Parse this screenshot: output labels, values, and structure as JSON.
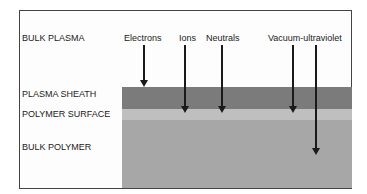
{
  "diagram": {
    "regions": [
      {
        "label": "BULK PLASMA"
      },
      {
        "label": "PLASMA SHEATH"
      },
      {
        "label": "POLYMER SURFACE"
      },
      {
        "label": "BULK POLYMER"
      }
    ],
    "species": [
      {
        "label": "Electrons",
        "penetrates_to": "plasma sheath"
      },
      {
        "label": "Ions",
        "penetrates_to": "polymer surface"
      },
      {
        "label": "Neutrals",
        "penetrates_to": "polymer surface"
      },
      {
        "label": "Vacuum-ultraviolet",
        "penetrates_to": "polymer surface / bulk polymer"
      }
    ],
    "colors": {
      "plasma_sheath": "#7b7b7b",
      "polymer_surface": "#bfbfbf",
      "bulk_polymer": "#a7a7a7"
    }
  }
}
